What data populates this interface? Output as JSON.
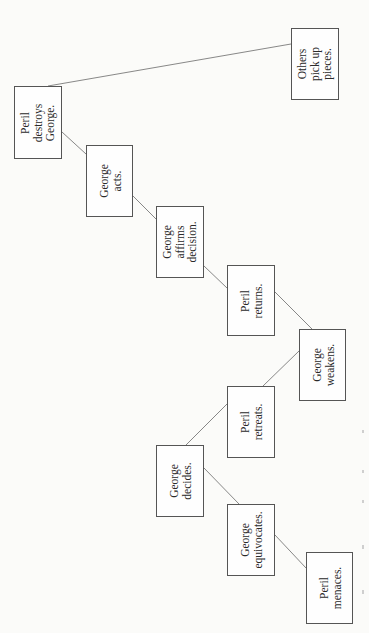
{
  "diagram": {
    "type": "plot-structure-tree",
    "orientation": "rotated-90-ccw",
    "colors": {
      "background": "#fbfbf9",
      "box_border": "#555555",
      "line": "#6a6a6a",
      "text": "#2a2a2a"
    },
    "nodes": [
      {
        "id": "others-pick-up-pieces",
        "lines": [
          "Others",
          "pick up",
          "pieces."
        ],
        "box": [
          291,
          28,
          48,
          72
        ]
      },
      {
        "id": "peril-destroys-george",
        "lines": [
          "Peril",
          "destroys",
          "George."
        ],
        "box": [
          14,
          86,
          48,
          73
        ]
      },
      {
        "id": "george-acts",
        "lines": [
          "George",
          "acts."
        ],
        "box": [
          86,
          145,
          47,
          72
        ]
      },
      {
        "id": "george-affirms-decision",
        "lines": [
          "George",
          "affirms",
          "decision."
        ],
        "box": [
          156,
          206,
          48,
          72
        ]
      },
      {
        "id": "peril-returns",
        "lines": [
          "Peril",
          "returns."
        ],
        "box": [
          227,
          265,
          48,
          71
        ]
      },
      {
        "id": "george-weakens",
        "lines": [
          "George",
          "weakens."
        ],
        "box": [
          299,
          329,
          47,
          72
        ]
      },
      {
        "id": "peril-retreats",
        "lines": [
          "Peril",
          "retreats."
        ],
        "box": [
          227,
          386,
          48,
          72
        ]
      },
      {
        "id": "george-decides",
        "lines": [
          "George",
          "decides."
        ],
        "box": [
          156,
          445,
          48,
          72
        ]
      },
      {
        "id": "george-equivocates",
        "lines": [
          "George",
          "equivocates."
        ],
        "box": [
          227,
          504,
          48,
          72
        ]
      },
      {
        "id": "peril-menaces",
        "lines": [
          "Peril",
          "menaces."
        ],
        "box": [
          306,
          552,
          47,
          72
        ]
      }
    ],
    "edges": [
      {
        "from": "peril-destroys-george",
        "to": "others-pick-up-pieces",
        "line": [
          48,
          86,
          291,
          44
        ]
      },
      {
        "from": "peril-destroys-george",
        "to": "george-acts",
        "line": [
          62,
          132,
          86,
          154
        ]
      },
      {
        "from": "george-acts",
        "to": "george-affirms-decision",
        "line": [
          133,
          196,
          156,
          219
        ]
      },
      {
        "from": "george-affirms-decision",
        "to": "peril-returns",
        "line": [
          204,
          266,
          227,
          288
        ]
      },
      {
        "from": "peril-returns",
        "to": "george-weakens",
        "line": [
          275,
          292,
          312,
          329
        ]
      },
      {
        "from": "george-weakens",
        "to": "peril-retreats",
        "line": [
          299,
          351,
          263,
          386
        ]
      },
      {
        "from": "peril-retreats",
        "to": "george-decides",
        "line": [
          227,
          404,
          186,
          445
        ]
      },
      {
        "from": "george-decides",
        "to": "george-equivocates",
        "line": [
          204,
          468,
          239,
          504
        ]
      },
      {
        "from": "george-equivocates",
        "to": "peril-menaces",
        "line": [
          275,
          535,
          306,
          568
        ]
      }
    ]
  }
}
